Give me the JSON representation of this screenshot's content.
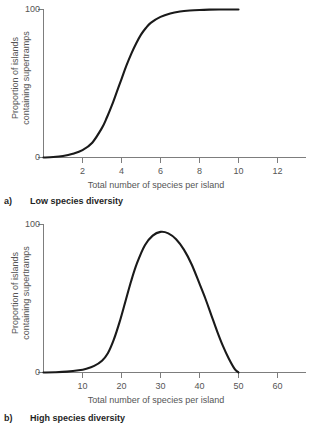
{
  "figure": {
    "background_color": "#ffffff",
    "curve_color": "#1a1a1a",
    "axis_color": "#7d7d7d",
    "label_color": "#555555"
  },
  "panels": [
    {
      "id": "a",
      "caption_letter": "a)",
      "caption_text": "Low species diversity",
      "ylabel_line1": "Proportion of islands",
      "ylabel_line2": "containing supertramps",
      "xlabel": "Total number of species per island",
      "ytick_labels": [
        "100",
        "0"
      ],
      "xtick_labels": [
        "2",
        "4",
        "6",
        "8",
        "10",
        "12"
      ]
    },
    {
      "id": "b",
      "caption_letter": "b)",
      "caption_text": "High species diversity",
      "ylabel_line1": "Proportion of islands",
      "ylabel_line2": "containing supertramps",
      "xlabel": "Total number of species per island",
      "ytick_labels": [
        "100",
        "0"
      ],
      "xtick_labels": [
        "10",
        "20",
        "30",
        "40",
        "50",
        "60"
      ]
    }
  ],
  "chart_data": [
    {
      "type": "line",
      "panel": "a",
      "title": "Low species diversity",
      "xlabel": "Total number of species per island",
      "ylabel": "Proportion of islands containing supertramps",
      "xlim": [
        0,
        13.5
      ],
      "ylim": [
        0,
        100
      ],
      "xticks": [
        2,
        4,
        6,
        8,
        10,
        12
      ],
      "yticks": [
        0,
        100
      ],
      "grid": false,
      "legend": null,
      "series": [
        {
          "name": "Proportion of islands containing supertramps",
          "x": [
            0.0,
            0.5,
            1.0,
            1.5,
            2.0,
            2.5,
            3.0,
            3.25,
            3.5,
            3.75,
            4.0,
            4.25,
            4.5,
            4.75,
            5.0,
            5.25,
            5.5,
            6.0,
            6.5,
            7.0,
            7.5,
            8.0,
            8.5,
            9.0,
            9.5,
            10.0
          ],
          "y": [
            0.0,
            0.3,
            1.0,
            2.5,
            5.0,
            10.0,
            20.0,
            27.0,
            35.0,
            44.0,
            53.0,
            62.0,
            70.0,
            77.0,
            83.0,
            87.5,
            91.0,
            95.0,
            97.3,
            98.6,
            99.3,
            99.7,
            99.9,
            100.0,
            100.0,
            100.0
          ]
        }
      ]
    },
    {
      "type": "line",
      "panel": "b",
      "title": "High species diversity",
      "xlabel": "Total number of species per island",
      "ylabel": "Proportion of islands containing supertramps",
      "xlim": [
        0,
        68
      ],
      "ylim": [
        0,
        100
      ],
      "xticks": [
        10,
        20,
        30,
        40,
        50,
        60
      ],
      "yticks": [
        0,
        100
      ],
      "grid": false,
      "legend": null,
      "series": [
        {
          "name": "Proportion of islands containing supertramps",
          "x": [
            0,
            3,
            6,
            9,
            11,
            13,
            15,
            16.5,
            18,
            19.5,
            21,
            22.5,
            24,
            26,
            28,
            30,
            32,
            34,
            36,
            38,
            40,
            41.5,
            43,
            44.5,
            46,
            47.5,
            49,
            50
          ],
          "y": [
            0.0,
            0.2,
            0.6,
            1.5,
            2.6,
            4.5,
            8.0,
            13.0,
            22.0,
            34.0,
            48.0,
            62.0,
            74.0,
            86.0,
            92.5,
            95.0,
            94.0,
            90.0,
            83.0,
            73.0,
            60.0,
            50.0,
            39.0,
            28.0,
            18.0,
            9.5,
            2.5,
            0.0
          ]
        }
      ]
    }
  ]
}
